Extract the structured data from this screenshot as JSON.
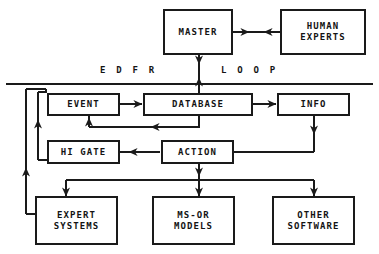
{
  "diagram": {
    "loop_label_left": "E  D  F  R",
    "loop_label_right": "L  O  O  P",
    "line_color": "#1a1a1a",
    "background_color": "#ffffff",
    "text_color": "#141414"
  },
  "nodes": {
    "master": {
      "label": "MASTER",
      "lines": [
        "MASTER"
      ]
    },
    "human_experts": {
      "label": "HUMAN EXPERTS",
      "lines": [
        "HUMAN",
        "EXPERTS"
      ]
    },
    "event": {
      "label": "EVENT",
      "lines": [
        "EVENT"
      ]
    },
    "database": {
      "label": "DATABASE",
      "lines": [
        "DATABASE"
      ]
    },
    "info": {
      "label": "INFO",
      "lines": [
        "INFO"
      ]
    },
    "hi_gate": {
      "label": "HI GATE",
      "lines": [
        "HI GATE"
      ]
    },
    "action": {
      "label": "ACTION",
      "lines": [
        "ACTION"
      ]
    },
    "expert_systems": {
      "label": "EXPERT SYSTEMS",
      "lines": [
        "EXPERT",
        "SYSTEMS"
      ]
    },
    "ms_or_models": {
      "label": "MS-OR MODELS",
      "lines": [
        "MS-OR",
        "MODELS"
      ]
    },
    "other_software": {
      "label": "OTHER SOFTWARE",
      "lines": [
        "OTHER",
        "SOFTWARE"
      ]
    }
  },
  "edges": [
    {
      "from": "master",
      "to": "human_experts",
      "direction": "bidirectional"
    },
    {
      "from": "master",
      "to": "database",
      "direction": "bidirectional"
    },
    {
      "from": "event",
      "to": "database",
      "direction": "forward"
    },
    {
      "from": "database",
      "to": "info",
      "direction": "forward"
    },
    {
      "from": "database",
      "to": "event",
      "direction": "feedback"
    },
    {
      "from": "action",
      "to": "hi_gate",
      "direction": "forward"
    },
    {
      "from": "action",
      "to": "event",
      "direction": "feedback"
    },
    {
      "from": "info",
      "to": "other_software",
      "direction": "forward"
    },
    {
      "from": "action",
      "to": "ms_or_models",
      "direction": "forward"
    },
    {
      "from": "action",
      "to": "expert_systems",
      "direction": "forward"
    },
    {
      "from": "expert_systems",
      "to": "hi_gate",
      "direction": "feedback"
    },
    {
      "from": "expert_systems",
      "to": "event",
      "direction": "feedback"
    }
  ]
}
